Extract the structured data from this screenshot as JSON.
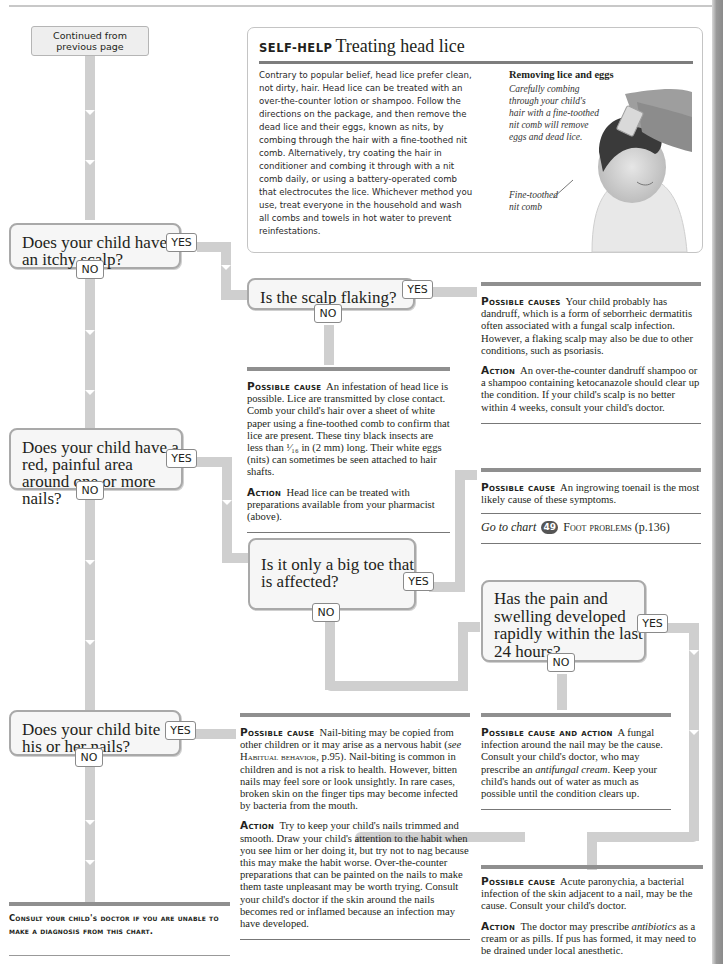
{
  "page": {
    "continued_label": "Continued from previous page"
  },
  "self_help": {
    "kicker": "SELF-HELP",
    "title": "Treating head lice",
    "body": "Contrary to popular belief, head lice prefer clean, not dirty, hair. Head lice can be treated with an over-the-counter lotion or shampoo. Follow the directions on the package, and then remove the dead lice and their eggs, known as nits, by combing through the hair with a fine-toothed nit comb. Alternatively, try coating the hair in conditioner and combing it through with a nit comb daily, or using a battery-operated comb that electrocutes the lice. Whichever method you use, treat everyone in the household and wash all combs and towels in hot water to prevent reinfestations.",
    "figure_title": "Removing lice and eggs",
    "figure_caption": "Carefully combing through your child's hair with a fine-toothed nit comb will remove eggs and dead lice.",
    "figure_label": "Fine-toothed nit comb",
    "figure_icon": "photo-child-hair-combing"
  },
  "questions": [
    {
      "id": "itchy-scalp",
      "text": "Does your child have an itchy scalp?",
      "yes": "YES",
      "no": "NO"
    },
    {
      "id": "scalp-flaking",
      "text": "Is the scalp flaking?",
      "yes": "YES",
      "no": "NO"
    },
    {
      "id": "red-painful-nail",
      "text": "Does your child have a red, painful area around one or more nails?",
      "yes": "YES",
      "no": "NO"
    },
    {
      "id": "big-toe",
      "text": "Is it only a big toe that is affected?",
      "yes": "YES",
      "no": "NO"
    },
    {
      "id": "rapid-swelling",
      "text": "Has the pain and swelling developed rapidly within the last 24 hours?",
      "yes": "YES",
      "no": "NO"
    },
    {
      "id": "bite-nails",
      "text": "Does your child bite his or her nails?",
      "yes": "YES",
      "no": "NO"
    }
  ],
  "outcomes": {
    "dandruff": {
      "cause_label": "Possible causes",
      "cause_text": "Your child probably has dandruff, which is a form of seborrheic dermatitis often associated with a fungal scalp infection. However, a flaking scalp may also be due to other conditions, such as psoriasis.",
      "action_label": "Action",
      "action_text": "An over-the-counter dandruff shampoo or a shampoo containing ketocanazole should clear up the condition. If your child's scalp is no better within 4 weeks, consult your child's doctor."
    },
    "head_lice": {
      "cause_label": "Possible cause",
      "cause_text": "An infestation of head lice is possible. Lice are transmitted by close contact. Comb your child's hair over a sheet of white paper using a fine-toothed comb to confirm that lice are present. These tiny black insects are less than ¹⁄₁₆ in (2 mm) long. Their white eggs (nits) can sometimes be seen attached to hair shafts.",
      "action_label": "Action",
      "action_text": "Head lice can be treated with preparations available from your pharmacist (above)."
    },
    "ingrowing_toenail": {
      "cause_label": "Possible cause",
      "cause_text": "An ingrowing toenail is the most likely cause of these symptoms.",
      "goto_prefix": "Go to chart",
      "goto_number": "49",
      "goto_title": "Foot problems",
      "goto_page": "(p.136)"
    },
    "fungal": {
      "cause_label": "Possible cause and action",
      "cause_text_1": "A fungal infection around the nail may be the cause. Consult your child's doctor, who may prescribe an ",
      "cause_em": "antifungal cream",
      "cause_text_2": ". Keep your child's hands out of water as much as possible until the condition clears up."
    },
    "nail_biting": {
      "cause_label": "Possible cause",
      "cause_text_1": "Nail-biting may be copied from other children or it may arise as a nervous habit (",
      "cause_see": "see",
      "cause_ref": "Habitual behavior",
      "cause_text_2": ", p.95). Nail-biting is common in children and is not a risk to health. However, bitten nails may feel sore or look unsightly. In rare cases, broken skin on the finger tips may become infected by bacteria from the mouth.",
      "action_label": "Action",
      "action_text": "Try to keep your child's nails trimmed and smooth. Draw your child's attention to the habit when you see him or her doing it, but try not to nag because this may make the habit worse. Over-the-counter preparations that can be painted on the nails to make them taste unpleasant may be worth trying. Consult your child's doctor if the skin around the nails becomes red or inflamed because an infection may have developed."
    },
    "paronychia": {
      "cause_label": "Possible cause",
      "cause_text": "Acute paronychia, a bacterial infection of the skin adjacent to a nail, may be the cause. Consult your child's doctor.",
      "action_label": "Action",
      "action_text_1": "The doctor may prescribe ",
      "action_em": "antibiotics",
      "action_text_2": " as a cream or as pills. If pus has formed, it may need to be drained under local anesthetic."
    }
  },
  "footer": {
    "consult": "Consult your child's doctor if you are unable to make a diagnosis from this chart."
  },
  "colors": {
    "connector": "#cfcfcf",
    "question_bg": "#f6f6f6",
    "question_border": "#a9a9a9",
    "rule": "#8f8f8f",
    "text": "#231f20"
  }
}
